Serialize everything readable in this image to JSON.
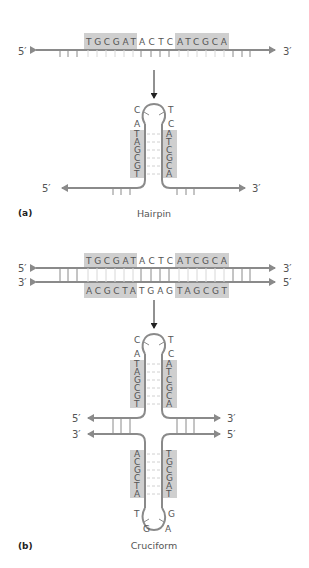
{
  "figure": {
    "panel_a": {
      "label": "(a)",
      "caption": "Hairpin",
      "linear": {
        "end_left": "5′",
        "end_right": "3′",
        "seq_left_box": "TGCGAT",
        "seq_middle": "ACTC",
        "seq_right_box": "ATCGCA"
      },
      "hairpin": {
        "end_left": "5′",
        "end_right": "3′",
        "loop_left": [
          "C",
          "A"
        ],
        "loop_right": [
          "T",
          "C"
        ],
        "stem_left": [
          "T",
          "A",
          "G",
          "C",
          "G",
          "T"
        ],
        "stem_right": [
          "A",
          "T",
          "C",
          "G",
          "C",
          "A"
        ]
      }
    },
    "panel_b": {
      "label": "(b)",
      "caption": "Cruciform",
      "duplex": {
        "top_end_left": "5′",
        "top_end_right": "3′",
        "bottom_end_left": "3′",
        "bottom_end_right": "5′",
        "top_left_box": "TGCGAT",
        "top_middle": "ACTC",
        "top_right_box": "ATCGCA",
        "bottom_left_box": "ACGCTA",
        "bottom_middle": "TGAG",
        "bottom_right_box": "TAGCGT"
      },
      "cruciform": {
        "upper_loop_left": [
          "C",
          "A"
        ],
        "upper_loop_right": [
          "T",
          "C"
        ],
        "upper_stem_left": [
          "T",
          "A",
          "G",
          "C",
          "G",
          "T"
        ],
        "upper_stem_right": [
          "A",
          "T",
          "C",
          "G",
          "C",
          "A"
        ],
        "arm_top_left": "5′",
        "arm_top_right": "3′",
        "arm_bottom_left": "3′",
        "arm_bottom_right": "5′",
        "lower_stem_left": [
          "A",
          "C",
          "G",
          "C",
          "T",
          "A"
        ],
        "lower_stem_right": [
          "T",
          "G",
          "C",
          "G",
          "A",
          "T"
        ],
        "lower_loop_left": [
          "T",
          "G"
        ],
        "lower_loop_right": [
          "G",
          "A"
        ]
      }
    },
    "colors": {
      "strand": "#8a8a8a",
      "box": "#cfcfcf",
      "text": "#555555",
      "arrow": "#222222"
    }
  }
}
